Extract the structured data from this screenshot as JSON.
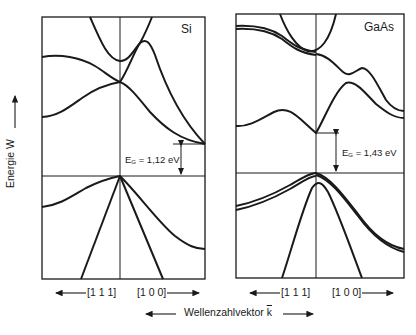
{
  "figure": {
    "y_axis_label": "Energie W",
    "x_axis_label": "Wellenzahlvektor",
    "x_axis_vector_symbol": "k",
    "colors": {
      "ink": "#1a1a1a",
      "background": "#ffffff"
    }
  },
  "panels": [
    {
      "id": "si",
      "title": "Si",
      "gap_label_prefix": "E",
      "gap_label_sub": "G",
      "gap_label_value": "= 1,12 eV",
      "gap_ev": 1.12,
      "gap_type": "indirect",
      "left_direction": "[1 1 1]",
      "right_direction": "[1 0 0]"
    },
    {
      "id": "gaas",
      "title": "GaAs",
      "gap_label_prefix": "E",
      "gap_label_sub": "G",
      "gap_label_value": "= 1,43 eV",
      "gap_ev": 1.43,
      "gap_type": "direct",
      "left_direction": "[1 1 1]",
      "right_direction": "[1 0 0]"
    }
  ]
}
